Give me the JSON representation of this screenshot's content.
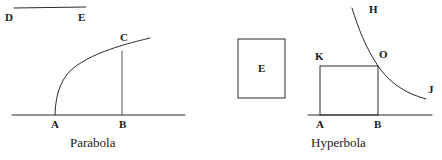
{
  "figure": {
    "background_color": "#ffffff",
    "stroke_color": "#2b2b2b",
    "text_color": "#1a1a1a",
    "width": 442,
    "height": 160
  },
  "segment_de": {
    "start_label": "D",
    "end_label": "E"
  },
  "parabola_diagram": {
    "caption": "Parabola",
    "labels": {
      "foot_left": "A",
      "foot_right": "B",
      "curve_top": "C"
    }
  },
  "square_e": {
    "label": "E"
  },
  "hyperbola_diagram": {
    "caption": "Hyperbola",
    "labels": {
      "curve_top": "H",
      "curve_end": "J",
      "rect_top_left": "K",
      "rect_top_right": "O",
      "foot_left": "A",
      "foot_right": "B"
    }
  }
}
